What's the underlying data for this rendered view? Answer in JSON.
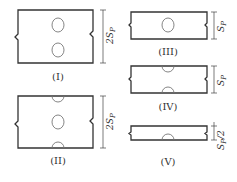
{
  "figure": {
    "panels": [
      {
        "id": "I",
        "label": "(I)",
        "dimension": "2S_P",
        "dimension_text": "2S",
        "dimension_sub": "P",
        "holes": "two full circles"
      },
      {
        "id": "II",
        "label": "(II)",
        "dimension": "2S_P",
        "dimension_text": "2S",
        "dimension_sub": "P",
        "holes": "half circles top and bottom, full circle center"
      },
      {
        "id": "III",
        "label": "(III)",
        "dimension": "S_P",
        "dimension_text": "S",
        "dimension_sub": "P",
        "holes": "one full circle"
      },
      {
        "id": "IV",
        "label": "(IV)",
        "dimension": "S_P",
        "dimension_text": "S",
        "dimension_sub": "P",
        "holes": "half circles top and bottom"
      },
      {
        "id": "V",
        "label": "(V)",
        "dimension": "S_P/2",
        "dimension_text": "S",
        "dimension_sub": "P",
        "dimension_suffix": "/2",
        "holes": "half circle bottom"
      }
    ]
  },
  "colors": {
    "stroke": "#333333",
    "hole": "#777777",
    "background": "#ffffff"
  }
}
